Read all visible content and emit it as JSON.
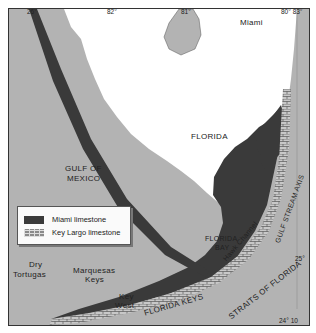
{
  "map": {
    "title": "South Florida limestone map",
    "colors": {
      "sea": "#b3b3b3",
      "land": "#ffffff",
      "miami_limestone": "#3a3a3a",
      "key_largo_limestone": "#8a8a8a",
      "border": "#333333"
    },
    "ticks": {
      "top": [
        "26°",
        "82°",
        "81°",
        "80° 83°"
      ],
      "right": [
        "25°",
        "24° 10"
      ]
    },
    "labels": {
      "miami": "Miami",
      "florida": "FLORIDA",
      "gulf_of_mexico_1": "GULF OF",
      "gulf_of_mexico_2": "MEXICO",
      "florida_bay_1": "FLORIDA",
      "florida_bay_2": "BAY",
      "hawk_channel": "Hawk Channel",
      "gulf_stream_axis": "GULF STREAM AXIS",
      "straits_of_florida": "STRAITS OF FLORIDA",
      "florida_keys": "FLORIDA KEYS",
      "dry_tortugas_1": "Dry",
      "dry_tortugas_2": "Tortugas",
      "marquesas_1": "Marquesas",
      "marquesas_2": "Keys",
      "key_west_1": "Key",
      "key_west_2": "West"
    },
    "legend": [
      {
        "label": "Miami limestone",
        "type": "miami"
      },
      {
        "label": "Key Largo limestone",
        "type": "kl"
      }
    ]
  }
}
